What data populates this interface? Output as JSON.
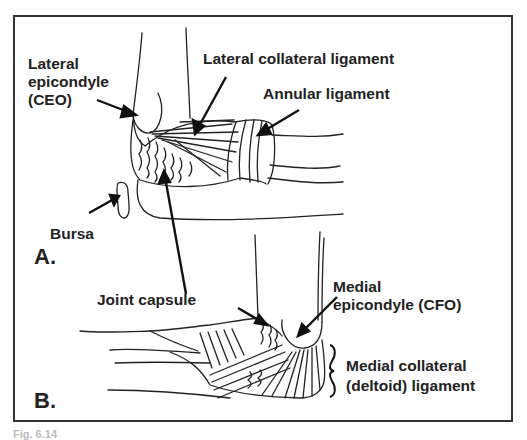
{
  "figure": {
    "caption": "Fig. 6.14",
    "panel_a": {
      "label": "A.",
      "labels": {
        "lateral_epicondyle_line1": "Lateral",
        "lateral_epicondyle_line2": "epicondyle",
        "lateral_epicondyle_line3": "(CEO)",
        "lateral_collateral_ligament": "Lateral collateral ligament",
        "annular_ligament": "Annular ligament",
        "bursa": "Bursa"
      }
    },
    "panel_b": {
      "label": "B.",
      "labels": {
        "joint_capsule": "Joint capsule",
        "medial_epicondyle_line1": "Medial",
        "medial_epicondyle_line2": "epicondyle (CFO)",
        "medial_collateral_line1": "Medial collateral",
        "medial_collateral_line2": "(deltoid) ligament"
      }
    },
    "colors": {
      "ink": "#222222",
      "frame": "#333333",
      "background": "#ffffff"
    }
  }
}
